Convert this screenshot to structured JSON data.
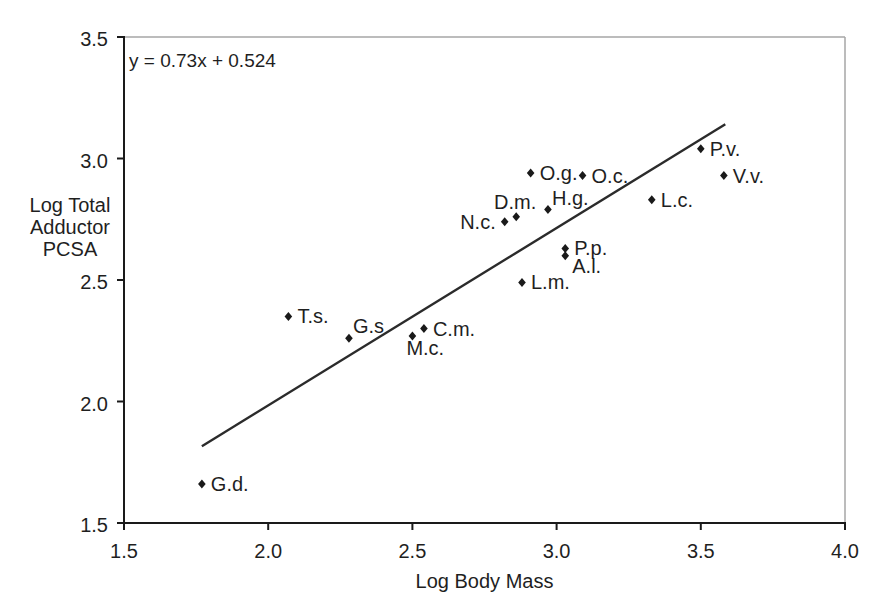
{
  "chart_data": {
    "type": "scatter",
    "title": "",
    "xlabel": "Log Body Mass",
    "ylabel": "Log Total Adductor PCSA",
    "ylabel_lines": [
      "Log Total",
      "Adductor",
      "PCSA"
    ],
    "equation_annotation": "y = 0.73x + 0.524",
    "xlim": [
      1.5,
      4.0
    ],
    "ylim": [
      1.5,
      3.5
    ],
    "xticks": [
      1.5,
      2.0,
      2.5,
      3.0,
      3.5,
      4.0
    ],
    "yticks": [
      3.5,
      3.0,
      2.5,
      2.0,
      1.5
    ],
    "grid": false,
    "legend": "none",
    "marker_shape": "diamond",
    "colors": {
      "marker": "#1a1a1a",
      "trendline": "#2b2b2b",
      "axis": "#1a1a1a",
      "frame": "#a6a6a6",
      "background": "#ffffff"
    },
    "trendline": {
      "slope": 0.73,
      "intercept": 0.524,
      "x_start": 1.77,
      "x_end": 3.585
    },
    "points": [
      {
        "label": "G.d.",
        "x": 1.77,
        "y": 1.66,
        "label_pos": "right"
      },
      {
        "label": "T.s.",
        "x": 2.07,
        "y": 2.35,
        "label_pos": "right"
      },
      {
        "label": "G.s",
        "x": 2.28,
        "y": 2.26,
        "label_pos": "above-right"
      },
      {
        "label": "M.c.",
        "x": 2.5,
        "y": 2.27,
        "label_pos": "below"
      },
      {
        "label": "C.m.",
        "x": 2.54,
        "y": 2.3,
        "label_pos": "right"
      },
      {
        "label": "L.m.",
        "x": 2.88,
        "y": 2.49,
        "label_pos": "right"
      },
      {
        "label": "N.c.",
        "x": 2.82,
        "y": 2.74,
        "label_pos": "left"
      },
      {
        "label": "D.m.",
        "x": 2.86,
        "y": 2.76,
        "label_pos": "above"
      },
      {
        "label": "O.g.",
        "x": 2.91,
        "y": 2.94,
        "label_pos": "right"
      },
      {
        "label": "H.g.",
        "x": 2.97,
        "y": 2.79,
        "label_pos": "above-right"
      },
      {
        "label": "O.c.",
        "x": 3.09,
        "y": 2.93,
        "label_pos": "right"
      },
      {
        "label": "P.p.",
        "x": 3.03,
        "y": 2.63,
        "label_pos": "right"
      },
      {
        "label": "A.l.",
        "x": 3.03,
        "y": 2.6,
        "label_pos": "below-right"
      },
      {
        "label": "L.c.",
        "x": 3.33,
        "y": 2.83,
        "label_pos": "right"
      },
      {
        "label": "P.v.",
        "x": 3.5,
        "y": 3.04,
        "label_pos": "right"
      },
      {
        "label": "V.v.",
        "x": 3.58,
        "y": 2.93,
        "label_pos": "right"
      }
    ]
  }
}
